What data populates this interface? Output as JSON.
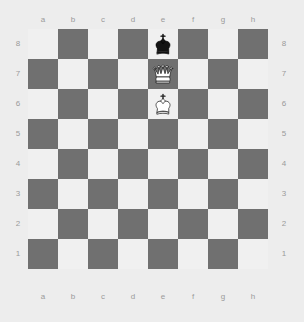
{
  "board": {
    "files": [
      "a",
      "b",
      "c",
      "d",
      "e",
      "f",
      "g",
      "h"
    ],
    "ranks": [
      "8",
      "7",
      "6",
      "5",
      "4",
      "3",
      "2",
      "1"
    ],
    "light_color": "#f0f0f0",
    "dark_color": "#707070",
    "background_color": "#ededed",
    "label_color": "#9a9a9a",
    "orientation": "white",
    "squares": 64,
    "pieces": [
      {
        "square": "e8",
        "file": "e",
        "rank": "8",
        "color": "black",
        "type": "king",
        "symbol": "♚",
        "name": "black-king"
      },
      {
        "square": "e7",
        "file": "e",
        "rank": "7",
        "color": "white",
        "type": "queen",
        "symbol": "♕",
        "name": "white-queen"
      },
      {
        "square": "e6",
        "file": "e",
        "rank": "6",
        "color": "white",
        "type": "king",
        "symbol": "♔",
        "name": "white-king"
      }
    ]
  },
  "chart_data": {
    "type": "heatmap",
    "xlabel": "file",
    "ylabel": "rank",
    "categories": [
      "a",
      "b",
      "c",
      "d",
      "e",
      "f",
      "g",
      "h"
    ],
    "rows": [
      "8",
      "7",
      "6",
      "5",
      "4",
      "3",
      "2",
      "1"
    ],
    "legend": [
      "light square",
      "dark square"
    ],
    "grid": true,
    "values": [
      [
        0,
        1,
        0,
        1,
        0,
        1,
        0,
        1
      ],
      [
        1,
        0,
        1,
        0,
        1,
        0,
        1,
        0
      ],
      [
        0,
        1,
        0,
        1,
        0,
        1,
        0,
        1
      ],
      [
        1,
        0,
        1,
        0,
        1,
        0,
        1,
        0
      ],
      [
        0,
        1,
        0,
        1,
        0,
        1,
        0,
        1
      ],
      [
        1,
        0,
        1,
        0,
        1,
        0,
        1,
        0
      ],
      [
        0,
        1,
        0,
        1,
        0,
        1,
        0,
        1
      ],
      [
        1,
        0,
        1,
        0,
        1,
        0,
        1,
        0
      ]
    ],
    "annotations": [
      {
        "x": "e",
        "y": "8",
        "label": "black king"
      },
      {
        "x": "e",
        "y": "7",
        "label": "white queen"
      },
      {
        "x": "e",
        "y": "6",
        "label": "white king"
      }
    ]
  }
}
